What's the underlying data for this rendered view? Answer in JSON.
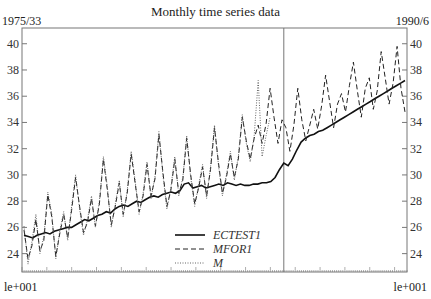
{
  "chart_data": {
    "type": "line",
    "title": "Monthly time series data",
    "start_label": "1975/33",
    "end_label": "1990/6",
    "x_start_label": "le+001",
    "x_end_label": "le+001",
    "ylabel": "",
    "xlabel": "",
    "ylim": [
      22.6,
      41.2
    ],
    "yticks": [
      24,
      26,
      28,
      30,
      32,
      34,
      36,
      38,
      40
    ],
    "grid": false,
    "legend_position": "lower-center",
    "forecast_start_fraction": 0.68,
    "series": [
      {
        "name": "ECTEST1",
        "style": "solid",
        "values": [
          25.4,
          25.3,
          25.2,
          25.4,
          25.5,
          25.6,
          25.5,
          25.7,
          25.8,
          25.9,
          26.0,
          26.0,
          26.2,
          26.4,
          26.6,
          26.5,
          26.7,
          26.9,
          27.0,
          27.2,
          27.1,
          27.4,
          27.6,
          27.7,
          27.6,
          27.8,
          28.0,
          27.9,
          28.1,
          28.3,
          28.4,
          28.3,
          28.5,
          28.6,
          28.7,
          28.6,
          28.8,
          29.3,
          29.4,
          29.0,
          29.1,
          29.2,
          29.0,
          29.1,
          29.2,
          29.3,
          29.2,
          29.4,
          29.3,
          29.2,
          29.3,
          29.2,
          29.2,
          29.3,
          29.3,
          29.4,
          29.4,
          29.5,
          29.8,
          30.4,
          30.9,
          30.7,
          31.2,
          31.9,
          32.5,
          32.8,
          33.0,
          33.1,
          33.3,
          33.4,
          33.6,
          33.8,
          34.0,
          34.2,
          34.4,
          34.6,
          34.8,
          35.0,
          35.2,
          35.4,
          35.6,
          35.8,
          36.0,
          36.2,
          36.4,
          36.6,
          36.8,
          37.0,
          37.2
        ]
      },
      {
        "name": "MFOR1",
        "style": "dashed",
        "values": [
          25.8,
          23.6,
          24.6,
          26.6,
          24.2,
          25.0,
          28.5,
          26.8,
          23.8,
          25.5,
          27.0,
          25.2,
          27.3,
          29.8,
          27.6,
          25.6,
          26.4,
          28.2,
          26.1,
          27.8,
          31.2,
          28.9,
          26.2,
          27.6,
          29.4,
          27.0,
          28.6,
          31.6,
          29.4,
          27.2,
          28.4,
          30.8,
          28.4,
          29.7,
          33.1,
          30.2,
          27.6,
          28.8,
          31.2,
          28.6,
          29.6,
          32.8,
          30.0,
          27.8,
          29.0,
          30.6,
          28.4,
          30.4,
          33.6,
          30.9,
          28.6,
          29.8,
          31.6,
          29.8,
          31.2,
          34.4,
          32.6,
          31.2,
          32.8,
          33.8,
          32.4,
          33.9,
          36.6,
          34.4,
          32.4,
          34.2,
          33.6,
          31.8,
          33.8,
          36.6,
          34.2,
          32.6,
          33.8,
          35.0,
          33.5,
          35.3,
          37.6,
          35.6,
          33.6,
          35.4,
          36.2,
          34.8,
          36.8,
          38.6,
          36.4,
          34.4,
          36.6,
          37.4,
          35.0,
          36.4,
          39.4,
          37.4,
          35.4,
          37.0,
          39.8,
          36.6,
          34.8
        ]
      },
      {
        "name": "M",
        "style": "dotted",
        "values": [
          26.1,
          23.2,
          24.9,
          27.0,
          24.0,
          25.3,
          28.7,
          27.0,
          23.6,
          25.7,
          27.2,
          25.0,
          27.6,
          30.0,
          27.4,
          25.4,
          26.6,
          28.4,
          26.0,
          28.0,
          31.4,
          29.1,
          26.0,
          27.8,
          29.6,
          26.8,
          28.8,
          31.8,
          29.6,
          27.0,
          28.6,
          31.0,
          28.2,
          29.9,
          33.3,
          30.0,
          27.4,
          29.0,
          31.4,
          28.4,
          29.8,
          33.0,
          29.8,
          27.6,
          29.2,
          30.8,
          28.2,
          30.6,
          33.8,
          30.7,
          28.4,
          30.0,
          31.8,
          29.6,
          31.4,
          34.6,
          32.4,
          31.0,
          33.0,
          37.2,
          31.4,
          33.0,
          34.4
        ]
      }
    ]
  }
}
